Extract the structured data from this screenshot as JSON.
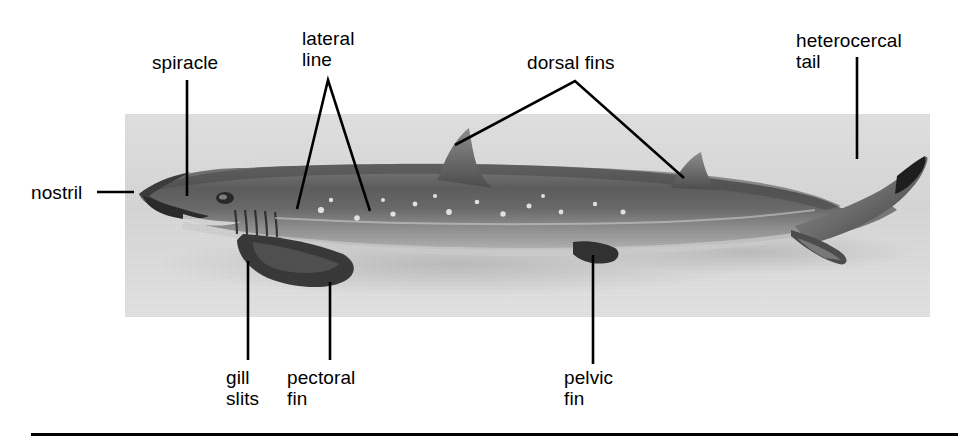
{
  "figure": {
    "photo": {
      "alt": "lateral view photograph of a dogfish shark specimen",
      "background_color": "#dcdcdc",
      "body_color": "#6e6e6e"
    },
    "rule_color": "#000000",
    "text_color": "#000000"
  },
  "labels": [
    {
      "id": "nostril",
      "text": "nostril",
      "x": 31,
      "y": 182
    },
    {
      "id": "spiracle",
      "text": "spiracle",
      "x": 152,
      "y": 52
    },
    {
      "id": "lateral-line",
      "text": "lateral\nline",
      "x": 302,
      "y": 28
    },
    {
      "id": "dorsal-fins",
      "text": "dorsal fins",
      "x": 527,
      "y": 52
    },
    {
      "id": "heterocercal-tail",
      "text": "heterocercal\ntail",
      "x": 796,
      "y": 30
    },
    {
      "id": "gill-slits",
      "text": "gill\nslits",
      "x": 226,
      "y": 367
    },
    {
      "id": "pectoral-fin",
      "text": "pectoral\nfin",
      "x": 287,
      "y": 367
    },
    {
      "id": "pelvic-fin",
      "text": "pelvic\nfin",
      "x": 564,
      "y": 367
    }
  ],
  "leader_lines": [
    {
      "id": "nostril-leader",
      "type": "horizontal",
      "points": "97,192 134,192"
    },
    {
      "id": "spiracle-leader",
      "type": "vertical",
      "points": "187,80 187,196"
    },
    {
      "id": "lateral-line-leader",
      "type": "vee",
      "points": "297,209 328,80 370,211"
    },
    {
      "id": "dorsal-fins-leader",
      "type": "caret",
      "points": "455,145 575,81 684,178"
    },
    {
      "id": "heterocercal-tail-leader",
      "type": "vertical",
      "points": "857,57 857,159"
    },
    {
      "id": "gill-slits-leader",
      "type": "vertical",
      "points": "248,261 248,360"
    },
    {
      "id": "pectoral-fin-leader",
      "type": "vertical",
      "points": "330,282 330,360"
    },
    {
      "id": "pelvic-fin-leader",
      "type": "vertical",
      "points": "593,255 593,364"
    }
  ]
}
